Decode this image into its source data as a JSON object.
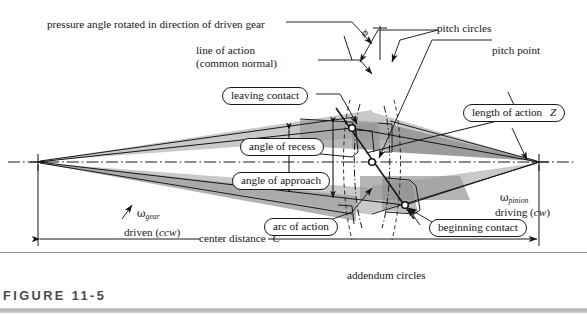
{
  "figure": {
    "caption": "FIGURE 11-5",
    "number": "11-5"
  },
  "diagram": {
    "type": "gear-tooth-action-diagram"
  },
  "labels": {
    "pressure_angle": "pressure angle rotated in direction of driven gear",
    "line_of_action_1": "line of action",
    "line_of_action_2": "(common normal)",
    "pitch_circles": "pitch circles",
    "pitch_point": "pitch point",
    "phi_symbol": "ϕ",
    "addendum_circles": "addendum circles",
    "center_distance": "center distance",
    "center_distance_symbol": "C",
    "omega_gear_symbol": "ω",
    "omega_gear_sub": "gear",
    "driven": "driven (",
    "driven_dir": "ccw",
    "driven_close": ")",
    "omega_pinion_symbol": "ω",
    "omega_pinion_sub": "pinion",
    "driving": "driving (",
    "driving_dir": "cw",
    "driving_close": ")"
  },
  "callouts": [
    {
      "id": "leaving-contact",
      "text": "leaving contact"
    },
    {
      "id": "angle-of-recess",
      "text": "angle of recess"
    },
    {
      "id": "angle-of-approach",
      "text": "angle of approach"
    },
    {
      "id": "arc-of-action",
      "text": "arc of action"
    },
    {
      "id": "beginning-contact",
      "text": "beginning contact"
    },
    {
      "id": "length-of-action",
      "text": "length of action",
      "symbol": "Z"
    }
  ],
  "colors": {
    "line": "#1a1a1a",
    "text": "#161616",
    "wedge_light": "#c9c9c9",
    "wedge_mid": "#a9a9a9",
    "wedge_dark": "#8f8f8f",
    "caption": "#4a4a4a",
    "caption_bar": "#c0c0c0",
    "background": "#ffffff"
  },
  "geometry": {
    "gear_center": {
      "x": 38,
      "y": 162,
      "name": "driven-gear-center"
    },
    "pinion_center": {
      "x": 539,
      "y": 162,
      "name": "driving-pinion-center"
    },
    "pitch_point": {
      "x": 372,
      "y": 162
    },
    "beginning_contact": {
      "x": 405,
      "y": 205
    },
    "leaving_contact": {
      "x": 352,
      "y": 128
    },
    "pressure_angle_deg": 20
  }
}
